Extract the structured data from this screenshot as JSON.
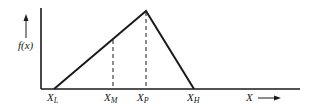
{
  "diagram": {
    "type": "triangular-distribution",
    "y_axis_label": "f(x)",
    "x_axis_label": "X",
    "points": {
      "low": {
        "label": "X",
        "sub": "L"
      },
      "mode_marker": {
        "label": "X",
        "sub": "M"
      },
      "peak": {
        "label": "X",
        "sub": "P"
      },
      "high": {
        "label": "X",
        "sub": "H"
      }
    },
    "colors": {
      "line": "#1a1a1a",
      "background": "#ffffff"
    }
  }
}
